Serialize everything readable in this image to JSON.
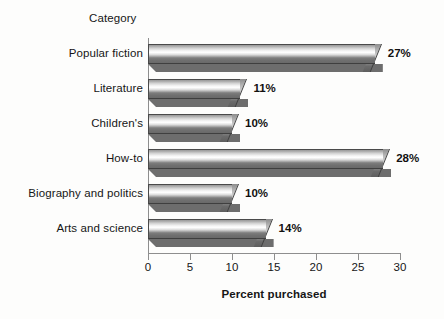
{
  "chart_data": {
    "type": "bar",
    "orientation": "horizontal",
    "title": "",
    "xlabel": "Percent purchased",
    "ylabel": "Category",
    "xlim": [
      0,
      30
    ],
    "xticks": [
      0,
      5,
      10,
      15,
      20,
      25,
      30
    ],
    "xtick_labels": [
      "0",
      "5",
      "10",
      "15",
      "20",
      "25",
      "30"
    ],
    "grid": false,
    "legend": null,
    "categories": [
      "Popular fiction",
      "Literature",
      "Children's",
      "How-to",
      "Biography and politics",
      "Arts and science"
    ],
    "values": [
      27,
      11,
      10,
      28,
      10,
      14
    ],
    "data_labels": [
      "27%",
      "11%",
      "10%",
      "28%",
      "10%",
      "14%"
    ],
    "colors": {
      "bar_light": "#ffffff",
      "bar_mid": "#b4b4b4",
      "bar_dark": "#6d6d6d",
      "bar_outline": "#3f3f3f",
      "axis": "#8e8e8e",
      "text": "#161616",
      "background": "#fdfdfc"
    }
  }
}
